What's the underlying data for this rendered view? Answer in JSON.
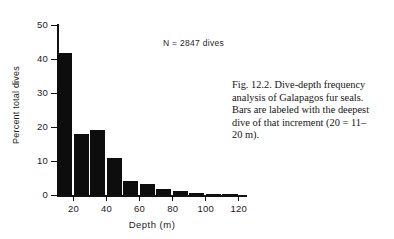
{
  "figure": {
    "annotation": "N = 2847 dives",
    "caption_lines": [
      "Fig. 12.2. Dive-depth frequency",
      "analysis of Galapagos fur seals.",
      "Bars are labeled with the deepest",
      "dive of that increment (20 = 11–",
      "20 m)."
    ],
    "caption_full": "Fig. 12.2. Dive-depth frequency analysis of Galapagos fur seals. Bars are labeled with the deepest dive of that increment (20 = 11–20 m)."
  },
  "chart_data": {
    "type": "bar",
    "title": "",
    "xlabel": "Depth (m)",
    "ylabel": "Percent total dives",
    "categories": [
      20,
      30,
      40,
      50,
      60,
      70,
      80,
      90,
      100,
      110,
      120
    ],
    "values": [
      42.0,
      18.0,
      19.2,
      11.0,
      4.2,
      3.4,
      2.0,
      1.2,
      0.6,
      0.4,
      0.3
    ],
    "bar_width_units": 10,
    "xlim": [
      10,
      125
    ],
    "ylim": [
      0,
      50
    ],
    "xticks": [
      20,
      40,
      60,
      80,
      100,
      120
    ],
    "xtick_labels": [
      "20",
      "40",
      "60",
      "80",
      "100",
      "120"
    ],
    "yticks": [
      0,
      10,
      20,
      30,
      40,
      50
    ],
    "ytick_labels": [
      "0",
      "10",
      "20",
      "30",
      "40",
      "50"
    ],
    "grid": false,
    "legend": false,
    "annotations": [
      "N = 2847 dives"
    ],
    "bar_color": "#0d0d0d",
    "axis_color": "#121212"
  }
}
